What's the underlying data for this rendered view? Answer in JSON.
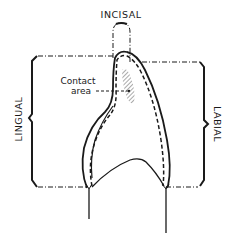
{
  "diagram": {
    "type": "dental-crown-outline",
    "labels": {
      "incisal": "INCISAL",
      "lingual": "LINGUAL",
      "labial": "LABIAL",
      "contact_line1": "Contact",
      "contact_line2": "area"
    },
    "colors": {
      "ink": "#1a1a1a",
      "background": "#ffffff",
      "hatch": "#555555"
    }
  }
}
